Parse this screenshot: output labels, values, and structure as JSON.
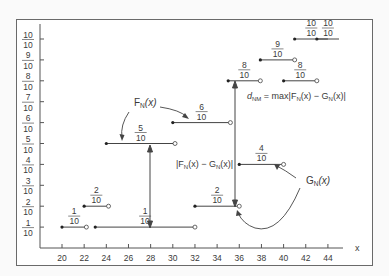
{
  "chart_data": {
    "type": "line",
    "title": "",
    "xlabel": "x",
    "ylabel": "",
    "xlim": [
      19,
      45
    ],
    "ylim": [
      0,
      1
    ],
    "x_ticks": [
      "20",
      "22",
      "24",
      "26",
      "28",
      "30",
      "32",
      "34",
      "36",
      "38",
      "40",
      "42",
      "44"
    ],
    "y_ticks": [
      {
        "num": "1",
        "den": "10"
      },
      {
        "num": "2",
        "den": "10"
      },
      {
        "num": "3",
        "den": "10"
      },
      {
        "num": "4",
        "den": "10"
      },
      {
        "num": "5",
        "den": "10"
      },
      {
        "num": "6",
        "den": "10"
      },
      {
        "num": "7",
        "den": "10"
      },
      {
        "num": "8",
        "den": "10"
      },
      {
        "num": "9",
        "den": "10"
      },
      {
        "num": "10",
        "den": "10"
      }
    ],
    "series": [
      {
        "name": "F_N(x)",
        "kind": "step",
        "segments": [
          {
            "x0": 20,
            "x1": 22.2,
            "y": 0.1,
            "label_num": "1",
            "label_den": "10"
          },
          {
            "x0": 22,
            "x1": 24.2,
            "y": 0.2,
            "label_num": "2",
            "label_den": "10"
          },
          {
            "x0": 24,
            "x1": 30.2,
            "y": 0.5,
            "label_num": "5",
            "label_den": "10"
          },
          {
            "x0": 30,
            "x1": 35.2,
            "y": 0.6,
            "label_num": "6",
            "label_den": "10"
          },
          {
            "x0": 35,
            "x1": 37.9,
            "y": 0.8,
            "label_num": "8",
            "label_den": "10"
          },
          {
            "x0": 37.9,
            "x1": 41,
            "y": 0.9,
            "label_num": "9",
            "label_den": "10"
          },
          {
            "x0": 41,
            "x1": 44,
            "y": 1.0,
            "label_num": "10",
            "label_den": "10"
          }
        ]
      },
      {
        "name": "G_N(x)",
        "kind": "step",
        "segments": [
          {
            "x0": 23,
            "x1": 32,
            "y": 0.1,
            "label_num": "1",
            "label_den": "10"
          },
          {
            "x0": 32,
            "x1": 36,
            "y": 0.2,
            "label_num": "2",
            "label_den": "10"
          },
          {
            "x0": 36,
            "x1": 40,
            "y": 0.4,
            "label_num": "4",
            "label_den": "10"
          },
          {
            "x0": 40,
            "x1": 43,
            "y": 0.8,
            "label_num": "8",
            "label_den": "10"
          },
          {
            "x0": 43,
            "x1": 45,
            "y": 1.0,
            "label_num": "10",
            "label_den": "10"
          }
        ]
      }
    ],
    "annotations": [
      {
        "text": "F_N(x)",
        "points_to": "F_N step at 5/10 and 6/10"
      },
      {
        "text": "G_N(x)",
        "points_to": "G_N step at 4/10 and 2/10"
      },
      {
        "text": "|F_N(x) − G_N(x)|",
        "at_x": 28.5,
        "between": [
          0.1,
          0.5
        ]
      },
      {
        "text": "d_NM = max|F_N(x) − G_N(x)|",
        "at_x": 35.5,
        "between": [
          0.2,
          0.8
        ]
      }
    ]
  },
  "labels": {
    "x_axis": "x",
    "F_label_main": "F",
    "F_label_sub": "N",
    "G_label_main": "G",
    "G_label_sub": "N",
    "arg": "(x)",
    "diff_label": "|F_N(x) − G_N(x)|",
    "diff_prefix": "|F",
    "diff_mid": "(x) − G",
    "diff_suffix": "(x)|",
    "dmax_d": "d",
    "dmax_sub": "NM",
    "dmax_rest": " = max|F",
    "dmax_mid": "(x) − G",
    "dmax_end": "(x)|",
    "sub_N": "N"
  }
}
